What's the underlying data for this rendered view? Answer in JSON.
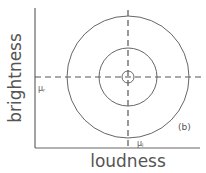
{
  "diagram": {
    "x_axis_label": "loudness",
    "y_axis_label": "brightness",
    "panel_label": "(b)",
    "x_mean_label": "μ",
    "x_mean_subscript": "l",
    "y_mean_label": "μ",
    "y_mean_subscript": "r",
    "center": {
      "x": 128,
      "y": 77
    },
    "circles": [
      {
        "name": "outer",
        "r": 61
      },
      {
        "name": "middle",
        "r": 29
      },
      {
        "name": "inner",
        "r": 6
      }
    ],
    "colors": {
      "stroke": "#555555",
      "background": "#ffffff"
    }
  }
}
